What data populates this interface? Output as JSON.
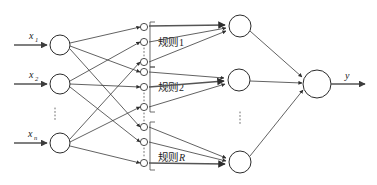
{
  "figure": {
    "type": "neural-network-diagram",
    "background_color": "#ffffff",
    "line_color": "#3a3a3a"
  },
  "input_layer": {
    "nodes": [
      {
        "id": "x1",
        "base": "x",
        "subscript": "1",
        "label": "x1"
      },
      {
        "id": "x2",
        "base": "x",
        "subscript": "2",
        "label": "x2"
      },
      {
        "id": "xn",
        "base": "x",
        "subscript": "n",
        "label": "xn"
      }
    ],
    "ellipsis": "⋮"
  },
  "membership_layer": {
    "groups": [
      {
        "id": "group-1",
        "node_count": 3,
        "ellipsis": "⋮"
      },
      {
        "id": "group-2",
        "node_count": 3,
        "ellipsis": "⋮"
      },
      {
        "id": "group-R",
        "node_count": 3,
        "ellipsis": "⋮"
      }
    ],
    "between_group_ellipsis": "⋮"
  },
  "rule_labels": [
    {
      "id": "rule-1",
      "text": "规则",
      "index": "1",
      "index_italic": false
    },
    {
      "id": "rule-2",
      "text": "规则",
      "index": "2",
      "index_italic": false
    },
    {
      "id": "rule-R",
      "text": "规则",
      "index": "R",
      "index_italic": true
    }
  ],
  "rule_layer": {
    "nodes": [
      {
        "id": "rule-node-1"
      },
      {
        "id": "rule-node-2"
      },
      {
        "id": "rule-node-R"
      }
    ],
    "ellipsis": "⋮"
  },
  "output_layer": {
    "node": {
      "id": "output-node"
    },
    "label": "y"
  }
}
